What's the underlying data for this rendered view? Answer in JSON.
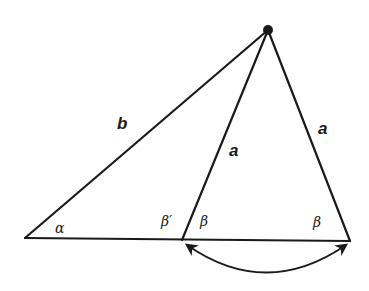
{
  "diagram": {
    "type": "geometry",
    "apex": {
      "x": 268,
      "y": 30,
      "marker": "filled-dot"
    },
    "vertices": {
      "left": {
        "x": 25,
        "y": 238
      },
      "middle": {
        "x": 182,
        "y": 240
      },
      "right": {
        "x": 350,
        "y": 241
      }
    },
    "sides": {
      "b": {
        "label": "b"
      },
      "a_inner": {
        "label": "a"
      },
      "a_outer": {
        "label": "a"
      }
    },
    "angles": {
      "alpha": "α",
      "beta_prime": "β′",
      "beta_middle": "β",
      "beta_right": "β"
    },
    "arc": {
      "description": "double-headed curved arrow beneath baseline connecting middle and right vertices",
      "arrowheads": "both"
    },
    "colors": {
      "stroke": "#1a1a1a",
      "background": "#ffffff"
    }
  }
}
